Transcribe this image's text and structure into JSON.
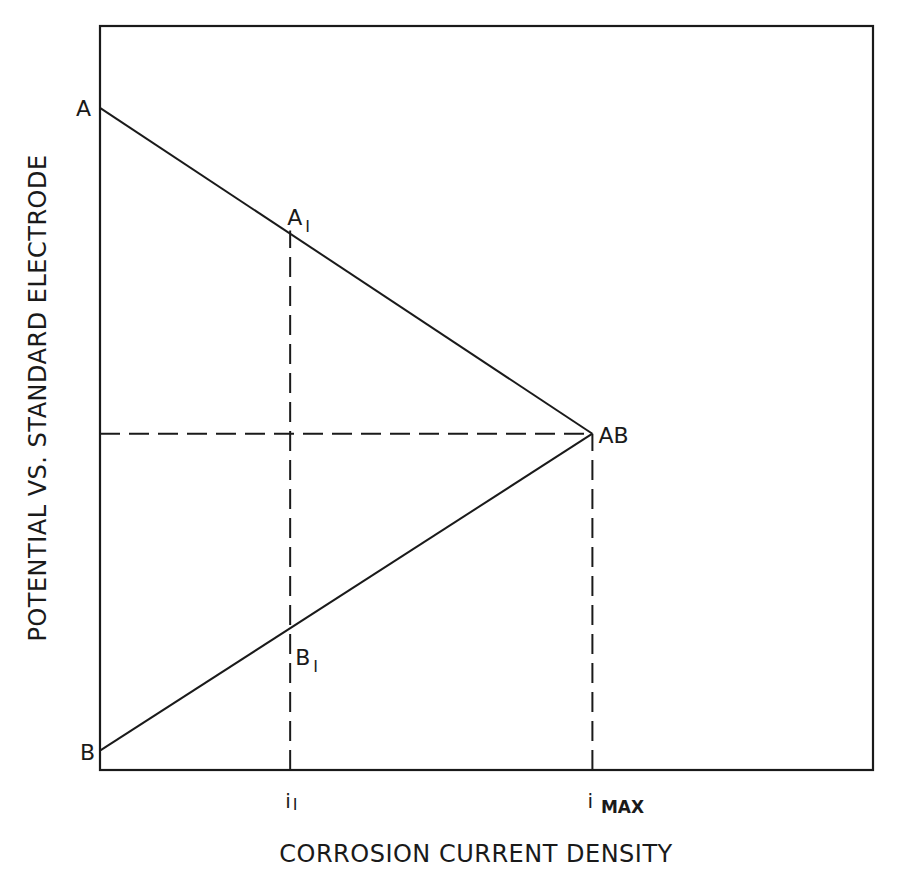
{
  "chart_data": {
    "type": "line",
    "title": "",
    "xlabel": "CORROSION CURRENT DENSITY",
    "ylabel": "POTENTIAL VS. STANDARD ELECTRODE",
    "xlim": [
      0,
      1
    ],
    "ylim": [
      0,
      1
    ],
    "grid": false,
    "series": [
      {
        "name": "Line A (cathodic)",
        "style": "solid",
        "points": [
          {
            "x": 0.0,
            "y": 0.89,
            "label": "A"
          },
          {
            "x": 0.637,
            "y": 0.452,
            "label": "AB"
          }
        ]
      },
      {
        "name": "Line B (anodic)",
        "style": "solid",
        "points": [
          {
            "x": 0.0,
            "y": 0.026,
            "label": "B"
          },
          {
            "x": 0.637,
            "y": 0.452,
            "label": "AB"
          }
        ]
      }
    ],
    "guides": [
      {
        "name": "i1-vertical",
        "style": "dashed",
        "from": {
          "x": 0.246,
          "y": 0.0
        },
        "to": {
          "x": 0.246,
          "y": 0.725
        }
      },
      {
        "name": "imax-vertical",
        "style": "dashed",
        "from": {
          "x": 0.637,
          "y": 0.0
        },
        "to": {
          "x": 0.637,
          "y": 0.452
        }
      },
      {
        "name": "ecorr-horizontal",
        "style": "dashed",
        "from": {
          "x": 0.0,
          "y": 0.452
        },
        "to": {
          "x": 0.637,
          "y": 0.452
        }
      }
    ],
    "point_labels": [
      {
        "id": "A",
        "text": "A",
        "sub": "",
        "x": 0.0,
        "y": 0.89
      },
      {
        "id": "A1",
        "text": "A",
        "sub": "I",
        "x": 0.246,
        "y": 0.725
      },
      {
        "id": "AB",
        "text": "AB",
        "sub": "",
        "x": 0.637,
        "y": 0.452
      },
      {
        "id": "B1",
        "text": "B",
        "sub": "I",
        "x": 0.246,
        "y": 0.165
      },
      {
        "id": "B",
        "text": "B",
        "sub": "",
        "x": 0.0,
        "y": 0.026
      }
    ],
    "x_ticks": [
      {
        "text": "i",
        "sub": "I",
        "x": 0.246
      },
      {
        "text": "i",
        "sub": "MAX",
        "x": 0.637
      }
    ]
  },
  "colors": {
    "ink": "#1a1a1a",
    "background": "#ffffff"
  }
}
